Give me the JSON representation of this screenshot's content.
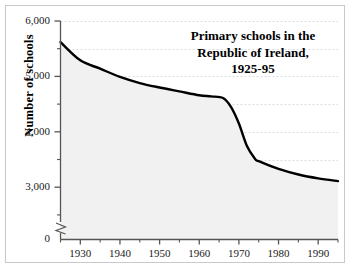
{
  "figure": {
    "title_lines": [
      "Primary schools in the",
      "Republic of Ireland,",
      "1925-95"
    ],
    "y_axis_title": "Number of schools",
    "colors": {
      "line": "#000000",
      "area_fill": "#f1f1f1",
      "gridline": "#d8dee4",
      "axis": "#555555",
      "frame": "#c9c9c9",
      "background": "#ffffff",
      "text": "#000000"
    }
  },
  "chart_data": {
    "type": "area",
    "title": "Primary schools in the Republic of Ireland, 1925-95",
    "xlabel": "",
    "ylabel": "Number of schools",
    "xlim": [
      1925,
      1995
    ],
    "ylim": [
      0,
      6000
    ],
    "y_axis_break": true,
    "y_axis_break_note": "axis broken between 0 and ~2,300",
    "grid": true,
    "grid_axis": "y",
    "grid_style": "dotted",
    "legend": false,
    "y_major_ticks": [
      3000,
      4000,
      5000,
      6000
    ],
    "y_major_tick_labels": [
      "3,000",
      "4,000",
      "5,000",
      "6,000"
    ],
    "y_minor_ticks": [
      2500,
      3500,
      4500,
      5500
    ],
    "y_origin_label": "0",
    "x_major_ticks": [
      1930,
      1940,
      1950,
      1960,
      1970,
      1980,
      1990
    ],
    "x_major_tick_labels": [
      "1930",
      "1940",
      "1950",
      "1960",
      "1970",
      "1980",
      "1990"
    ],
    "x_minor_ticks": [
      1925,
      1935,
      1945,
      1955,
      1965,
      1975,
      1985,
      1995
    ],
    "x": [
      1925,
      1930,
      1935,
      1940,
      1945,
      1950,
      1955,
      1960,
      1963,
      1966,
      1968,
      1970,
      1972,
      1974,
      1975,
      1980,
      1985,
      1990,
      1995
    ],
    "values": [
      5620,
      5290,
      5140,
      4990,
      4880,
      4800,
      4730,
      4660,
      4640,
      4610,
      4450,
      4150,
      3750,
      3520,
      3470,
      3330,
      3230,
      3160,
      3110
    ],
    "series": [
      {
        "name": "Number of schools",
        "values": [
          5620,
          5290,
          5140,
          4990,
          4880,
          4800,
          4730,
          4660,
          4640,
          4610,
          4450,
          4150,
          3750,
          3520,
          3470,
          3330,
          3230,
          3160,
          3110
        ]
      }
    ]
  }
}
